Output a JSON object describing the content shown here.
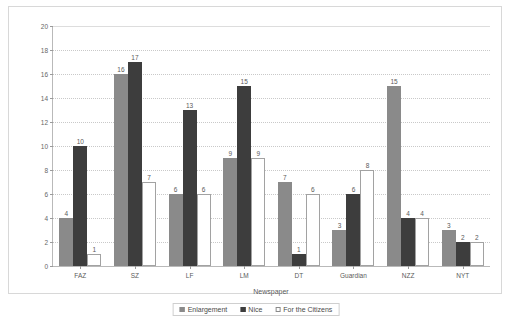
{
  "chart_data": {
    "type": "bar",
    "title": "",
    "xlabel": "Newspaper",
    "ylabel": "",
    "ylim": [
      0,
      20
    ],
    "ytick_step": 2,
    "yticks": [
      0,
      2,
      4,
      6,
      8,
      10,
      12,
      14,
      16,
      18,
      20
    ],
    "grid": true,
    "legend_position": "bottom",
    "categories": [
      "FAZ",
      "SZ",
      "LF",
      "LM",
      "DT",
      "Guardian",
      "NZZ",
      "NYT"
    ],
    "series": [
      {
        "name": "Enlargement",
        "color": "#8a8a8a",
        "values": [
          4,
          16,
          6,
          9,
          7,
          3,
          15,
          3
        ]
      },
      {
        "name": "Nice",
        "color": "#3d3d3d",
        "values": [
          10,
          17,
          13,
          15,
          1,
          6,
          4,
          2
        ]
      },
      {
        "name": "For the Citizens",
        "color": "#ffffff",
        "values": [
          1,
          7,
          6,
          9,
          6,
          8,
          4,
          2
        ]
      }
    ]
  }
}
